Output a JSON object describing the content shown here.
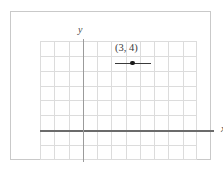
{
  "figure": {
    "type": "coordinate-plane",
    "axes": {
      "x_label": "x",
      "y_label": "y"
    },
    "point": {
      "label": "(3, 4)",
      "x": 3,
      "y": 4
    }
  },
  "chart_data": {
    "type": "scatter",
    "title": "",
    "xlabel": "x",
    "ylabel": "y",
    "grid": true,
    "legend": "none",
    "xlim": [
      -4,
      7
    ],
    "ylim": [
      -2,
      6
    ],
    "x_gridlines": 11,
    "y_gridlines": 8,
    "points": [
      {
        "x": 3,
        "y": 4,
        "label": "(3, 4)",
        "marker": "filled-circle",
        "annotation": "horizontal-segment-through-point"
      }
    ],
    "series": [
      {
        "name": "plotted-point",
        "x": [
          3
        ],
        "y": [
          4
        ]
      }
    ],
    "colors": {
      "grid": "#dcdcdc",
      "x_axis": "#6b6b6b",
      "y_axis": "#9b9b9b",
      "point": "#1a1a1a",
      "frame": "#c9c9c9",
      "background": "#ffffff"
    }
  }
}
